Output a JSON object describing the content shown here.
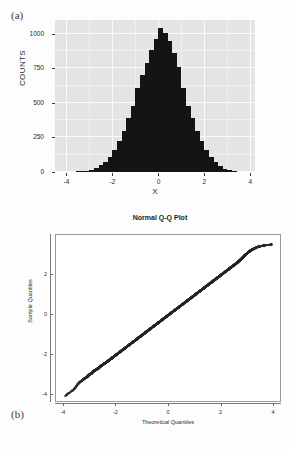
{
  "figure": {
    "panel_a_letter": "(a)",
    "panel_b_letter": "(b)"
  },
  "chart_data": [
    {
      "type": "bar",
      "panel": "(a)",
      "title": "",
      "xlabel": "X",
      "ylabel": "COUNTS",
      "xlim": [
        -4.5,
        4.2
      ],
      "ylim": [
        0,
        1100
      ],
      "xticks": [
        -4,
        -2,
        0,
        2,
        4
      ],
      "xticklabels": [
        "-4",
        "-2",
        "0",
        "2",
        "4"
      ],
      "yticks": [
        0,
        250,
        500,
        750,
        1000
      ],
      "yticklabels": [
        "0",
        "250",
        "500",
        "750",
        "1000"
      ],
      "grid": true,
      "legend": "none",
      "bar_color": "#141414",
      "panel_background": "#e4e4e4",
      "bin_width": 0.2,
      "bin_centers": [
        -3.5,
        -3.3,
        -3.1,
        -2.9,
        -2.7,
        -2.5,
        -2.3,
        -2.1,
        -1.9,
        -1.7,
        -1.5,
        -1.3,
        -1.1,
        -0.9,
        -0.7,
        -0.5,
        -0.3,
        -0.1,
        0.1,
        0.3,
        0.5,
        0.7,
        0.9,
        1.1,
        1.3,
        1.5,
        1.7,
        1.9,
        2.1,
        2.3,
        2.5,
        2.7,
        2.9,
        3.1,
        3.3
      ],
      "values": [
        3,
        6,
        10,
        18,
        30,
        48,
        75,
        110,
        160,
        225,
        300,
        390,
        480,
        610,
        700,
        790,
        880,
        960,
        1040,
        1005,
        950,
        860,
        760,
        610,
        480,
        390,
        300,
        225,
        160,
        110,
        75,
        45,
        25,
        12,
        5
      ]
    },
    {
      "type": "scatter",
      "panel": "(b)",
      "title": "Normal Q-Q Plot",
      "xlabel": "Theoretical Quantiles",
      "ylabel": "Sample Quantiles",
      "xlim": [
        -4.3,
        4.3
      ],
      "ylim": [
        -4.4,
        4.0
      ],
      "xticks": [
        -4,
        -2,
        0,
        2,
        4
      ],
      "xticklabels": [
        "-4",
        "-2",
        "0",
        "2",
        "4"
      ],
      "yticks": [
        -4,
        -2,
        0,
        2
      ],
      "yticklabels": [
        "-4",
        "-2",
        "0",
        "2"
      ],
      "grid": false,
      "legend": "none",
      "point_color": "#111111",
      "marker": "open-circle",
      "description": "Sample quantiles fall on a straight 45-degree reference line indicating normality; slight departures at both tails.",
      "x": [
        -3.95,
        -3.62,
        -3.42,
        -3.3,
        -3.2,
        -3.12,
        -3.05,
        -2.98,
        -2.92,
        -2.86,
        -2.8,
        -2.74,
        -2.68,
        -2.62,
        -2.56,
        -2.5,
        -2.44,
        -2.38,
        -2.32,
        -2.26,
        -2.2,
        -2.14,
        -2.08,
        -2.02,
        -1.96,
        -1.9,
        -1.84,
        -1.78,
        -1.72,
        -1.66,
        -1.6,
        -1.54,
        -1.48,
        -1.42,
        -1.36,
        -1.3,
        -1.24,
        -1.18,
        -1.12,
        -1.06,
        -1.0,
        -0.94,
        -0.88,
        -0.82,
        -0.76,
        -0.7,
        -0.64,
        -0.58,
        -0.52,
        -0.46,
        -0.4,
        -0.34,
        -0.28,
        -0.22,
        -0.16,
        -0.1,
        -0.04,
        0.02,
        0.08,
        0.14,
        0.2,
        0.26,
        0.32,
        0.38,
        0.44,
        0.5,
        0.56,
        0.62,
        0.68,
        0.74,
        0.8,
        0.86,
        0.92,
        0.98,
        1.04,
        1.1,
        1.16,
        1.22,
        1.28,
        1.34,
        1.4,
        1.46,
        1.52,
        1.58,
        1.64,
        1.7,
        1.76,
        1.82,
        1.88,
        1.94,
        2.0,
        2.06,
        2.12,
        2.18,
        2.24,
        2.3,
        2.36,
        2.42,
        2.48,
        2.54,
        2.6,
        2.66,
        2.72,
        2.78,
        2.84,
        2.9,
        2.96,
        3.04,
        3.12,
        3.2,
        3.3,
        3.42,
        3.55,
        3.72,
        3.9
      ],
      "y": [
        -4.05,
        -3.72,
        -3.38,
        -3.26,
        -3.16,
        -3.1,
        -3.0,
        -2.95,
        -2.88,
        -2.8,
        -2.76,
        -2.7,
        -2.66,
        -2.58,
        -2.52,
        -2.46,
        -2.42,
        -2.36,
        -2.3,
        -2.24,
        -2.18,
        -2.12,
        -2.06,
        -2.0,
        -1.94,
        -1.88,
        -1.82,
        -1.76,
        -1.7,
        -1.64,
        -1.58,
        -1.52,
        -1.46,
        -1.4,
        -1.34,
        -1.28,
        -1.22,
        -1.16,
        -1.1,
        -1.04,
        -0.98,
        -0.92,
        -0.86,
        -0.8,
        -0.74,
        -0.68,
        -0.62,
        -0.56,
        -0.5,
        -0.44,
        -0.38,
        -0.32,
        -0.26,
        -0.2,
        -0.14,
        -0.08,
        -0.02,
        0.04,
        0.1,
        0.16,
        0.22,
        0.28,
        0.34,
        0.4,
        0.46,
        0.52,
        0.58,
        0.64,
        0.7,
        0.76,
        0.82,
        0.88,
        0.94,
        1.0,
        1.06,
        1.12,
        1.18,
        1.24,
        1.3,
        1.36,
        1.42,
        1.48,
        1.54,
        1.6,
        1.66,
        1.72,
        1.78,
        1.84,
        1.9,
        1.96,
        2.02,
        2.08,
        2.14,
        2.2,
        2.26,
        2.32,
        2.38,
        2.44,
        2.5,
        2.56,
        2.62,
        2.7,
        2.76,
        2.84,
        2.92,
        3.0,
        3.06,
        3.16,
        3.24,
        3.3,
        3.36,
        3.42,
        3.46,
        3.5,
        3.52
      ]
    }
  ]
}
